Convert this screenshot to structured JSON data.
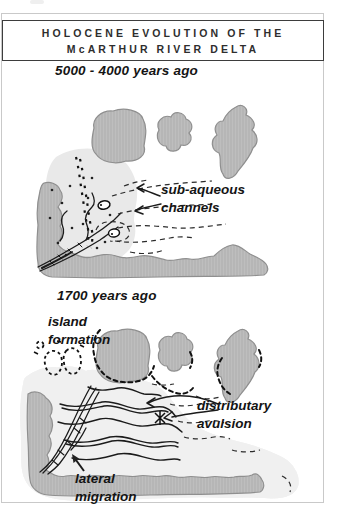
{
  "figure": {
    "title_line1": "HOLOCENE EVOLUTION OF THE",
    "title_line2": "McARTHUR RIVER DELTA"
  },
  "panel1": {
    "heading": "5000 - 4000 years ago",
    "label_subaqueous": "sub-aqueous\nchannels"
  },
  "panel2": {
    "heading": "1700 years ago",
    "label_island_formation": "island\nformation",
    "label_distributary_avulsion": "distributary\navulsion",
    "label_lateral_migration": "lateral\nmigration"
  },
  "colors": {
    "land_gray": "#b6b6b6",
    "land_outline": "#8f8f8f",
    "plain_gray": "#e9e9e9",
    "frame_gray": "#c9c9c9",
    "ink": "#1b1b1b",
    "background": "#ffffff"
  }
}
